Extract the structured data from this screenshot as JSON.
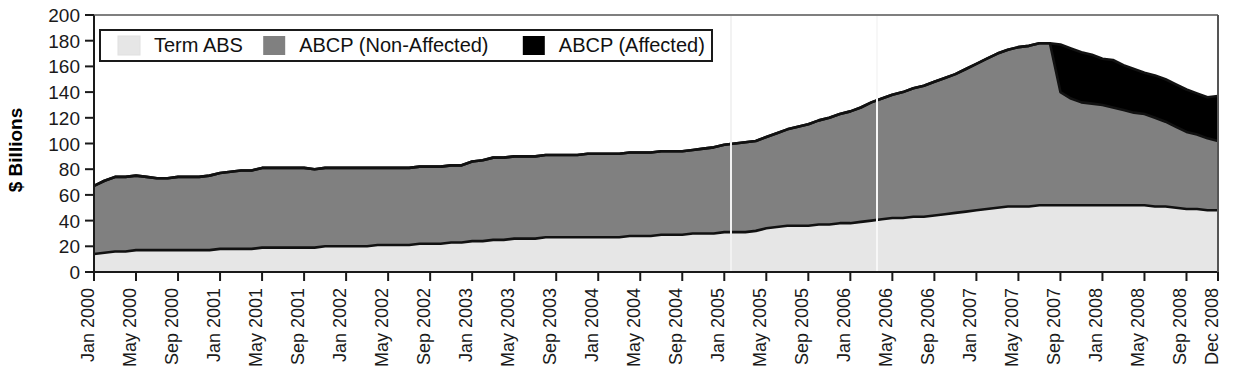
{
  "chart_data": {
    "type": "area",
    "stacked": true,
    "title": "",
    "subtitle": "",
    "xlabel": "",
    "ylabel": "$ Billions",
    "ylim": [
      0,
      200
    ],
    "ytick_values": [
      0,
      20,
      40,
      60,
      80,
      100,
      120,
      140,
      160,
      180,
      200
    ],
    "ytick_labels": [
      "0",
      "20",
      "40",
      "60",
      "80",
      "100",
      "120",
      "140",
      "160",
      "180",
      "200"
    ],
    "grid": false,
    "legend_position": "top-left-inside",
    "legend_entries": [
      {
        "label": "Term ABS",
        "color": "#e6e6e6"
      },
      {
        "label": "ABCP (Non-Affected)",
        "color": "#808080"
      },
      {
        "label": "ABCP (Affected)",
        "color": "#000000"
      }
    ],
    "xtick_labels": [
      "Jan 2000",
      "May 2000",
      "Sep 2000",
      "Jan 2001",
      "May 2001",
      "Sep 2001",
      "Jan 2002",
      "May 2002",
      "Sep 2002",
      "Jan 2003",
      "May 2003",
      "Sep 2003",
      "Jan 2004",
      "May 2004",
      "Sep 2004",
      "Jan 2005",
      "May 2005",
      "Sep 2005",
      "Jan 2006",
      "May 2006",
      "Sep 2006",
      "Jan 2007",
      "May 2007",
      "Sep 2007",
      "Jan 2008",
      "May 2008",
      "Sep 2008",
      "Dec 2008"
    ],
    "x": [
      "Jan 2000",
      "Feb 2000",
      "Mar 2000",
      "Apr 2000",
      "May 2000",
      "Jun 2000",
      "Jul 2000",
      "Aug 2000",
      "Sep 2000",
      "Oct 2000",
      "Nov 2000",
      "Dec 2000",
      "Jan 2001",
      "Feb 2001",
      "Mar 2001",
      "Apr 2001",
      "May 2001",
      "Jun 2001",
      "Jul 2001",
      "Aug 2001",
      "Sep 2001",
      "Oct 2001",
      "Nov 2001",
      "Dec 2001",
      "Jan 2002",
      "Feb 2002",
      "Mar 2002",
      "Apr 2002",
      "May 2002",
      "Jun 2002",
      "Jul 2002",
      "Aug 2002",
      "Sep 2002",
      "Oct 2002",
      "Nov 2002",
      "Dec 2002",
      "Jan 2003",
      "Feb 2003",
      "Mar 2003",
      "Apr 2003",
      "May 2003",
      "Jun 2003",
      "Jul 2003",
      "Aug 2003",
      "Sep 2003",
      "Oct 2003",
      "Nov 2003",
      "Dec 2003",
      "Jan 2004",
      "Feb 2004",
      "Mar 2004",
      "Apr 2004",
      "May 2004",
      "Jun 2004",
      "Jul 2004",
      "Aug 2004",
      "Sep 2004",
      "Oct 2004",
      "Nov 2004",
      "Dec 2004",
      "Jan 2005",
      "Feb 2005",
      "Mar 2005",
      "Apr 2005",
      "May 2005",
      "Jun 2005",
      "Jul 2005",
      "Aug 2005",
      "Sep 2005",
      "Oct 2005",
      "Nov 2005",
      "Dec 2005",
      "Jan 2006",
      "Feb 2006",
      "Mar 2006",
      "Apr 2006",
      "May 2006",
      "Jun 2006",
      "Jul 2006",
      "Aug 2006",
      "Sep 2006",
      "Oct 2006",
      "Nov 2006",
      "Dec 2006",
      "Jan 2007",
      "Feb 2007",
      "Mar 2007",
      "Apr 2007",
      "May 2007",
      "Jun 2007",
      "Jul 2007",
      "Aug 2007",
      "Sep 2007",
      "Oct 2007",
      "Nov 2007",
      "Dec 2007",
      "Jan 2008",
      "Feb 2008",
      "Mar 2008",
      "Apr 2008",
      "May 2008",
      "Jun 2008",
      "Jul 2008",
      "Aug 2008",
      "Sep 2008",
      "Oct 2008",
      "Nov 2008",
      "Dec 2008"
    ],
    "series": [
      {
        "name": "Term ABS",
        "color": "#e6e6e6",
        "values": [
          14,
          15,
          16,
          16,
          17,
          17,
          17,
          17,
          17,
          17,
          17,
          17,
          18,
          18,
          18,
          18,
          19,
          19,
          19,
          19,
          19,
          19,
          20,
          20,
          20,
          20,
          20,
          21,
          21,
          21,
          21,
          22,
          22,
          22,
          23,
          23,
          24,
          24,
          25,
          25,
          26,
          26,
          26,
          27,
          27,
          27,
          27,
          27,
          27,
          27,
          27,
          28,
          28,
          28,
          29,
          29,
          29,
          30,
          30,
          30,
          31,
          31,
          31,
          32,
          34,
          35,
          36,
          36,
          36,
          37,
          37,
          38,
          38,
          39,
          40,
          41,
          42,
          42,
          43,
          43,
          44,
          45,
          46,
          47,
          48,
          49,
          50,
          51,
          51,
          51,
          52,
          52,
          52,
          52,
          52,
          52,
          52,
          52,
          52,
          52,
          52,
          51,
          51,
          50,
          49,
          49,
          48,
          48
        ]
      },
      {
        "name": "ABCP (Non-Affected)",
        "color": "#808080",
        "values": [
          53,
          56,
          58,
          58,
          58,
          57,
          56,
          56,
          57,
          57,
          57,
          58,
          59,
          60,
          61,
          61,
          62,
          62,
          62,
          62,
          62,
          61,
          61,
          61,
          61,
          61,
          61,
          60,
          60,
          60,
          60,
          60,
          60,
          60,
          60,
          60,
          62,
          63,
          64,
          64,
          64,
          64,
          64,
          64,
          64,
          64,
          64,
          65,
          65,
          65,
          65,
          65,
          65,
          65,
          65,
          65,
          65,
          65,
          66,
          67,
          68,
          69,
          70,
          70,
          71,
          73,
          75,
          77,
          79,
          81,
          83,
          85,
          87,
          89,
          92,
          94,
          96,
          98,
          100,
          102,
          104,
          106,
          108,
          111,
          114,
          117,
          120,
          122,
          124,
          125,
          126,
          126,
          88,
          83,
          80,
          79,
          78,
          76,
          74,
          72,
          71,
          69,
          66,
          63,
          60,
          58,
          56,
          54
        ]
      },
      {
        "name": "ABCP (Affected)",
        "color": "#000000",
        "values": [
          0,
          0,
          0,
          0,
          0,
          0,
          0,
          0,
          0,
          0,
          0,
          0,
          0,
          0,
          0,
          0,
          0,
          0,
          0,
          0,
          0,
          0,
          0,
          0,
          0,
          0,
          0,
          0,
          0,
          0,
          0,
          0,
          0,
          0,
          0,
          0,
          0,
          0,
          0,
          0,
          0,
          0,
          0,
          0,
          0,
          0,
          0,
          0,
          0,
          0,
          0,
          0,
          0,
          0,
          0,
          0,
          0,
          0,
          0,
          0,
          0,
          0,
          0,
          0,
          0,
          0,
          0,
          0,
          0,
          0,
          0,
          0,
          0,
          0,
          0,
          0,
          0,
          0,
          0,
          0,
          0,
          0,
          0,
          0,
          0,
          0,
          0,
          0,
          0,
          0,
          0,
          0,
          37,
          39,
          39,
          38,
          36,
          37,
          35,
          34,
          32,
          33,
          33,
          33,
          33,
          32,
          32,
          35
        ]
      }
    ],
    "notes": {
      "peak_total": 178,
      "peak_month": "Aug 2007",
      "start_total": 67,
      "end_total": 137
    }
  }
}
